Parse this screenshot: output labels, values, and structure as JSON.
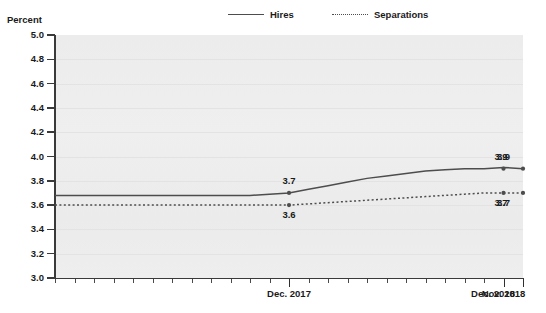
{
  "axis_title": "Percent",
  "legend": {
    "items": [
      {
        "label": "Hires",
        "style": "solid",
        "color": "#4d4d4d"
      },
      {
        "label": "Separations",
        "style": "dotted",
        "color": "#4d4d4d"
      }
    ]
  },
  "chart_data": {
    "type": "line",
    "title": "",
    "xlabel": "",
    "ylabel": "Percent",
    "ylim": [
      3.0,
      5.0
    ],
    "ytick_step": 0.2,
    "ytick_labels": [
      "5.0",
      "4.8",
      "4.6",
      "4.4",
      "4.2",
      "4.0",
      "3.8",
      "3.6",
      "3.4",
      "3.2",
      "3.0"
    ],
    "ytick_values": [
      5.0,
      4.8,
      4.6,
      4.4,
      4.2,
      4.0,
      3.8,
      3.6,
      3.4,
      3.2,
      3.0
    ],
    "grid": true,
    "legend_position": "top-center",
    "x_labeled_ticks": [
      "Dec. 2017",
      "Nov. 2018",
      "Dec. 2018"
    ],
    "x_count": 25,
    "series": [
      {
        "name": "Hires",
        "style": "solid",
        "values": [
          3.68,
          3.68,
          3.68,
          3.68,
          3.68,
          3.68,
          3.68,
          3.68,
          3.68,
          3.68,
          3.68,
          3.69,
          3.7,
          3.73,
          3.76,
          3.79,
          3.82,
          3.84,
          3.86,
          3.88,
          3.89,
          3.9,
          3.9,
          3.91,
          3.9
        ],
        "labeled_points": [
          {
            "x_label": "Dec. 2017",
            "index": 12,
            "value": 3.7,
            "text": "3.7",
            "position": "above"
          },
          {
            "x_label": "Nov. 2018",
            "index": 23,
            "value": 3.9,
            "text": "3.9",
            "position": "above"
          },
          {
            "x_label": "Dec. 2018",
            "index": 24,
            "value": 3.9,
            "text": "3.9",
            "position": "above"
          }
        ]
      },
      {
        "name": "Separations",
        "style": "dotted",
        "values": [
          3.6,
          3.6,
          3.6,
          3.6,
          3.6,
          3.6,
          3.6,
          3.6,
          3.6,
          3.6,
          3.6,
          3.6,
          3.6,
          3.61,
          3.62,
          3.63,
          3.64,
          3.65,
          3.66,
          3.67,
          3.68,
          3.69,
          3.7,
          3.7,
          3.7
        ],
        "labeled_points": [
          {
            "x_label": "Dec. 2017",
            "index": 12,
            "value": 3.6,
            "text": "3.6",
            "position": "below"
          },
          {
            "x_label": "Nov. 2018",
            "index": 23,
            "value": 3.7,
            "text": "3.7",
            "position": "below"
          },
          {
            "x_label": "Dec. 2018",
            "index": 24,
            "value": 3.7,
            "text": "3.7",
            "position": "below"
          }
        ]
      }
    ]
  }
}
